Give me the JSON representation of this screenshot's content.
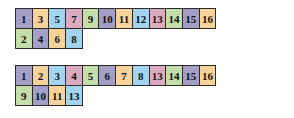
{
  "blocks": [
    {
      "rows": [
        [
          {
            "label": "1",
            "color": "purple"
          },
          {
            "label": "3",
            "color": "orange"
          },
          {
            "label": "5",
            "color": "blue"
          },
          {
            "label": "7",
            "color": "pink"
          },
          {
            "label": "9",
            "color": "green"
          },
          {
            "label": "10",
            "color": "purple"
          },
          {
            "label": "11",
            "color": "orange"
          },
          {
            "label": "12",
            "color": "blue"
          },
          {
            "label": "13",
            "color": "pink"
          },
          {
            "label": "14",
            "color": "green"
          },
          {
            "label": "15",
            "color": "purple"
          },
          {
            "label": "16",
            "color": "orange"
          }
        ],
        [
          {
            "label": "2",
            "color": "green"
          },
          {
            "label": "4",
            "color": "purple"
          },
          {
            "label": "6",
            "color": "orange"
          },
          {
            "label": "8",
            "color": "blue"
          }
        ]
      ]
    },
    {
      "rows": [
        [
          {
            "label": "1",
            "color": "purple"
          },
          {
            "label": "2",
            "color": "orange"
          },
          {
            "label": "3",
            "color": "blue"
          },
          {
            "label": "4",
            "color": "pink"
          },
          {
            "label": "5",
            "color": "green"
          },
          {
            "label": "6",
            "color": "purple"
          },
          {
            "label": "7",
            "color": "orange"
          },
          {
            "label": "8",
            "color": "blue"
          },
          {
            "label": "13",
            "color": "pink"
          },
          {
            "label": "14",
            "color": "green"
          },
          {
            "label": "15",
            "color": "purple"
          },
          {
            "label": "16",
            "color": "orange"
          }
        ],
        [
          {
            "label": "9",
            "color": "green"
          },
          {
            "label": "10",
            "color": "purple"
          },
          {
            "label": "11",
            "color": "orange"
          },
          {
            "label": "13",
            "color": "blue"
          }
        ]
      ]
    }
  ],
  "colors": {
    "purple": "#a39fc6",
    "orange": "#f5d39b",
    "blue": "#a2d4f0",
    "pink": "#dcaabf",
    "green": "#c5dda8"
  }
}
